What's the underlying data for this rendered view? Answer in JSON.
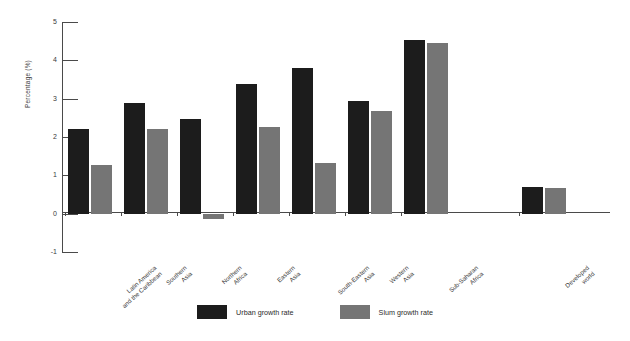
{
  "chart_data": {
    "type": "bar",
    "title": "",
    "subtitle": "",
    "xlabel": "",
    "ylabel": "Percentage (%)",
    "ylim": [
      -1,
      5
    ],
    "yticks": [
      -1,
      0,
      1,
      2,
      3,
      4,
      5
    ],
    "ytick_labels": [
      "-1",
      "0",
      "1",
      "2",
      "3",
      "4",
      "5"
    ],
    "grid": false,
    "legend_position": "bottom-center",
    "categories": [
      "Latin America and the Caribbean",
      "Southern Asia",
      "Northern Africa",
      "Eastern Asia",
      "South-Eastern Asia",
      "Western Asia",
      "Sub-Saharan Africa",
      "Developed world"
    ],
    "category_lines": [
      [
        "Latin America",
        "and the Caribbean"
      ],
      [
        "Southern",
        "Asia"
      ],
      [
        "Northern",
        "Africa"
      ],
      [
        "Eastern",
        "Asia"
      ],
      [
        "South-Eastern",
        "Asia"
      ],
      [
        "Western",
        "Asia"
      ],
      [
        "Sub-Saharan",
        "Africa"
      ],
      [
        "Developed",
        "world"
      ]
    ],
    "series": [
      {
        "name": "Urban growth rate",
        "color": "#1c1c1c",
        "values": [
          2.2,
          2.88,
          2.47,
          3.37,
          3.8,
          2.95,
          4.52,
          0.7
        ]
      },
      {
        "name": "Slum growth rate",
        "color": "#757575",
        "values": [
          1.27,
          2.2,
          -0.15,
          2.27,
          1.33,
          2.68,
          4.45,
          0.67
        ]
      }
    ]
  },
  "legend": {
    "items": [
      {
        "label": "Urban growth rate",
        "color": "#1c1c1c"
      },
      {
        "label": "Slum growth rate",
        "color": "#757575"
      }
    ]
  },
  "axes": {
    "y_title": "Percentage (%)"
  },
  "colors": {
    "urban": "#1c1c1c",
    "slum": "#757575",
    "axis": "#4a4a4a",
    "text": "#3a3a3a",
    "background": "#ffffff"
  }
}
